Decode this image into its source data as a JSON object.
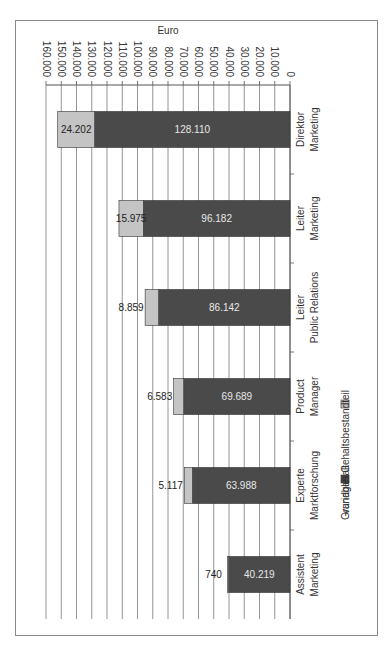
{
  "chart_data": {
    "type": "bar",
    "stacked": true,
    "orientation": "vertical",
    "page_rotation_deg": 90,
    "title": "",
    "xlabel": "",
    "ylabel": "Euro",
    "ylim": [
      0,
      160000
    ],
    "yticks": [
      "0",
      "10.000",
      "20.000",
      "30.000",
      "40.000",
      "50.000",
      "60.000",
      "70.000",
      "80.000",
      "90.000",
      "100.000",
      "110.000",
      "120.000",
      "130.000",
      "140.000",
      "150.000",
      "160.000"
    ],
    "grid": true,
    "legend_position": "bottom",
    "categories": [
      [
        "Direktor",
        "Marketing"
      ],
      [
        "Leiter",
        "Marketing"
      ],
      [
        "Leiter",
        "Public Relations"
      ],
      [
        "Product",
        "Manager"
      ],
      [
        "Experte",
        "Marktforschung"
      ],
      [
        "Assistent",
        "Marketing"
      ]
    ],
    "series": [
      {
        "name": "Grundgehalt",
        "color": "#4a4a4a",
        "values": [
          128110,
          96182,
          86142,
          69689,
          63988,
          40219
        ],
        "labels": [
          "128.110",
          "96.182",
          "86.142",
          "69.689",
          "63.988",
          "40.219"
        ]
      },
      {
        "name": "variabler Gehaltsbestandteil",
        "color": "#c4c4c4",
        "values": [
          24202,
          15975,
          8859,
          6583,
          5117,
          740
        ],
        "labels": [
          "24.202",
          "15.975",
          "8.859",
          "6.583",
          "5.117",
          "740"
        ]
      }
    ]
  }
}
